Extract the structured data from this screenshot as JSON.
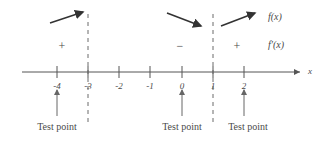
{
  "figure": {
    "axis": {
      "variable_label": "x",
      "tick_labels": [
        "-4",
        "-3",
        "-2",
        "-1",
        "0",
        "1",
        "2"
      ],
      "tick_values": [
        -4,
        -3,
        -2,
        -1,
        0,
        1,
        2
      ]
    },
    "critical_values": [
      "-3",
      "1"
    ],
    "intervals": [
      {
        "sign": "+",
        "direction": "increasing"
      },
      {
        "sign": "−",
        "direction": "decreasing"
      },
      {
        "sign": "+",
        "direction": "increasing"
      }
    ],
    "curve_labels": {
      "function": "f(x)",
      "derivative": "f′(x)"
    },
    "test_points": [
      {
        "label": "Test point",
        "value": "-4"
      },
      {
        "label": "Test point",
        "value": "0"
      },
      {
        "label": "Test point",
        "value": "2"
      }
    ],
    "colors": {
      "ink": "#4a4a4a",
      "axis": "#555555",
      "dashed": "#6b6b6b",
      "background": "#ffffff"
    }
  }
}
